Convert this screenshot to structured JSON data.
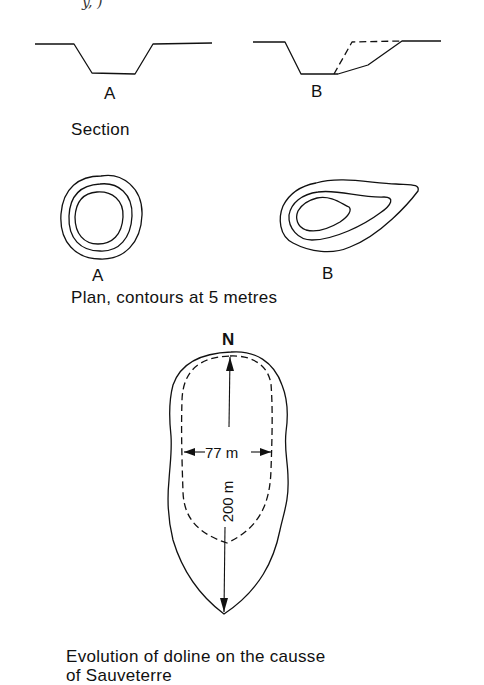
{
  "figure": {
    "top_fragment": "y, )",
    "section": {
      "label_a": "A",
      "label_b": "B",
      "caption": "Section"
    },
    "plan": {
      "label_a": "A",
      "label_b": "B",
      "caption": "Plan, contours at 5 metres"
    },
    "doline": {
      "north_label": "N",
      "width_label": "77 m",
      "length_label": "200 m"
    },
    "caption_line1": "Evolution of doline on the causse",
    "caption_line2": "of Sauveterre"
  },
  "colors": {
    "line": "#111111",
    "background": "#ffffff"
  }
}
